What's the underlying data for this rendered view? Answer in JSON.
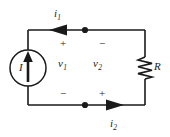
{
  "figure": {
    "type": "circuit-diagram",
    "title": "",
    "background_color": "#ffffff",
    "line_color": "#1a1a1a",
    "width": 170,
    "height": 137
  },
  "labels": {
    "current_top": "i",
    "current_top_sub": "1",
    "current_bottom": "i",
    "current_bottom_sub": "2",
    "voltage_left": "v",
    "voltage_left_sub": "1",
    "voltage_right": "v",
    "voltage_right_sub": "2",
    "source": "I",
    "resistor": "R"
  },
  "polarity": {
    "top_left": "+",
    "top_right": "−",
    "bottom_left": "−",
    "bottom_right": "+"
  },
  "components": [
    {
      "name": "current-source",
      "symbol": "circle-with-up-arrow",
      "label": "I",
      "position": "left-branch"
    },
    {
      "name": "resistor",
      "symbol": "zigzag",
      "label": "R",
      "position": "right-branch"
    },
    {
      "name": "node-dot-top",
      "symbol": "junction-dot",
      "position": "top-wire"
    },
    {
      "name": "node-dot-bottom",
      "symbol": "junction-dot",
      "position": "bottom-wire"
    }
  ],
  "arrows": [
    {
      "name": "i1-arrow",
      "direction": "left",
      "wire": "top"
    },
    {
      "name": "i2-arrow",
      "direction": "right",
      "wire": "bottom"
    },
    {
      "name": "source-arrow",
      "direction": "up",
      "wire": "left-branch"
    }
  ]
}
